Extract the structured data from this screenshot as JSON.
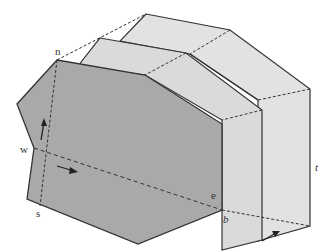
{
  "diagram": {
    "colors": {
      "front_face": "#a9a9a9",
      "slab_faces": "#dedede",
      "slab_top": "#e6e6e6",
      "edges": "#333333"
    },
    "labels": {
      "n": "n",
      "w": "w",
      "s": "s",
      "e": "e",
      "b": "b",
      "t": "t"
    },
    "arrows": [
      {
        "name": "up-arrow",
        "direction": "north"
      },
      {
        "name": "east-arrow",
        "direction": "east"
      },
      {
        "name": "along-t-arrow",
        "direction": "along-axis"
      }
    ]
  }
}
